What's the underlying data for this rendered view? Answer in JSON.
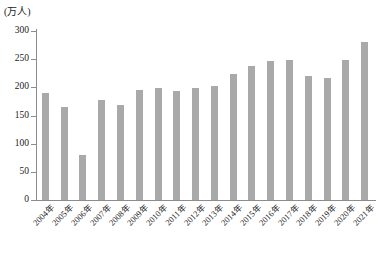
{
  "chart_data": {
    "type": "bar",
    "title": "",
    "subtitle": "",
    "unit_label": "(万人)",
    "xlabel": "",
    "ylabel": "",
    "ylim": [
      0,
      300
    ],
    "yticks": [
      0,
      50,
      100,
      150,
      200,
      250,
      300
    ],
    "ytick_labels": [
      "0",
      "50",
      "100",
      "150",
      "200",
      "250",
      "300"
    ],
    "grid": false,
    "legend": null,
    "bar_color": "#a9a9a9",
    "axis_color": "#8c8c8c",
    "categories": [
      "2004年",
      "2005年",
      "2006年",
      "2007年",
      "2008年",
      "2009年",
      "2010年",
      "2011年",
      "2012年",
      "2013年",
      "2014年",
      "2015年",
      "2016年",
      "2017年",
      "2018年",
      "2019年",
      "2020年",
      "2021年"
    ],
    "values": [
      190,
      165,
      80,
      177,
      169,
      196,
      199,
      193,
      198,
      202,
      223,
      238,
      246,
      248,
      220,
      216,
      249,
      281
    ],
    "series": [
      {
        "name": "人数",
        "values": [
          190,
          165,
          80,
          177,
          169,
          196,
          199,
          193,
          198,
          202,
          223,
          238,
          246,
          248,
          220,
          216,
          249,
          281
        ]
      }
    ]
  }
}
